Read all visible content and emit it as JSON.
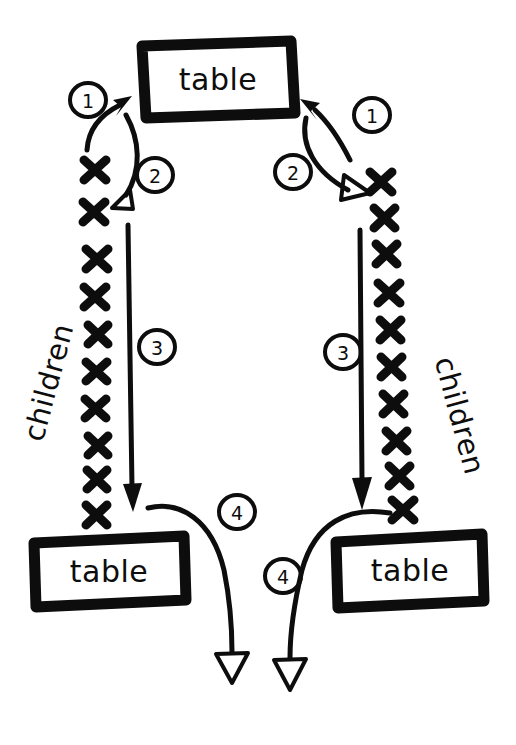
{
  "diagram": {
    "style": "hand-drawn marker sketch, black ink on white paper",
    "canvas": {
      "width": 516,
      "height": 745
    },
    "ink_color": "#0d0d0d",
    "paper_color": "#ffffff"
  },
  "boxes": [
    {
      "id": "table-top",
      "label": "table",
      "x": 141,
      "y": 40,
      "w": 154,
      "h": 78
    },
    {
      "id": "table-bottom-left",
      "label": "table",
      "x": 32,
      "y": 535,
      "w": 154,
      "h": 72
    },
    {
      "id": "table-bottom-right",
      "label": "table",
      "x": 334,
      "y": 534,
      "w": 150,
      "h": 74
    }
  ],
  "labels": {
    "children_left": "children",
    "children_right": "children"
  },
  "steps": [
    {
      "number": "1",
      "side": "left",
      "cx": 88,
      "cy": 100,
      "meaning": "child points up to parent table"
    },
    {
      "number": "2",
      "side": "left",
      "cx": 155,
      "cy": 175,
      "meaning": "table points down to first child"
    },
    {
      "number": "3",
      "side": "left",
      "cx": 157,
      "cy": 347,
      "meaning": "walk down the children list"
    },
    {
      "number": "4",
      "side": "left",
      "cx": 237,
      "cy": 512,
      "meaning": "last child points onward"
    },
    {
      "number": "1",
      "side": "right",
      "cx": 372,
      "cy": 115,
      "meaning": "child points up to parent table"
    },
    {
      "number": "2",
      "side": "right",
      "cx": 293,
      "cy": 172,
      "meaning": "table points down to first child"
    },
    {
      "number": "3",
      "side": "right",
      "cx": 343,
      "cy": 352,
      "meaning": "walk down the children list"
    },
    {
      "number": "4",
      "side": "right",
      "cx": 283,
      "cy": 576,
      "meaning": "last child points onward"
    }
  ],
  "children_marks": {
    "glyph": "x",
    "left_count": 10,
    "right_count": 10
  },
  "arrow_styles": {
    "step1": "thin curved arrow, solid arrowhead, pointing up-right into table",
    "step2": "thin curved arrow, hollow arrowhead, pointing down to first child",
    "step3": "long straight vertical line, solid arrowhead at bottom",
    "step4": "long curved arrow, hollow triangular arrowhead, exiting downward"
  }
}
